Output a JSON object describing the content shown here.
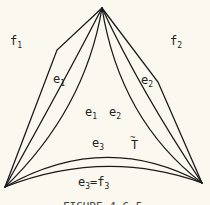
{
  "figure": {
    "labels": {
      "f1": {
        "base": "f",
        "sub": "1"
      },
      "f2": {
        "base": "f",
        "sub": "2"
      },
      "e1": {
        "base": "e",
        "sub": "1"
      },
      "e2": {
        "base": "e",
        "sub": "2"
      },
      "e1p": {
        "base": "e",
        "sub": "1",
        "prime": "!"
      },
      "e2p": {
        "base": "e",
        "sub": "2",
        "prime": "!"
      },
      "e3p": {
        "base": "e",
        "sub": "3",
        "prime": "!"
      },
      "T": {
        "text": "T",
        "accent": "~"
      },
      "e3f3": {
        "base1": "e",
        "sub1": "3",
        "eq": "=",
        "base2": "f",
        "sub2": "3"
      }
    },
    "caption": "FIGURE 4.6.5",
    "colors": {
      "background": "#fbf9ef",
      "ink": "#1a1a1a"
    }
  }
}
